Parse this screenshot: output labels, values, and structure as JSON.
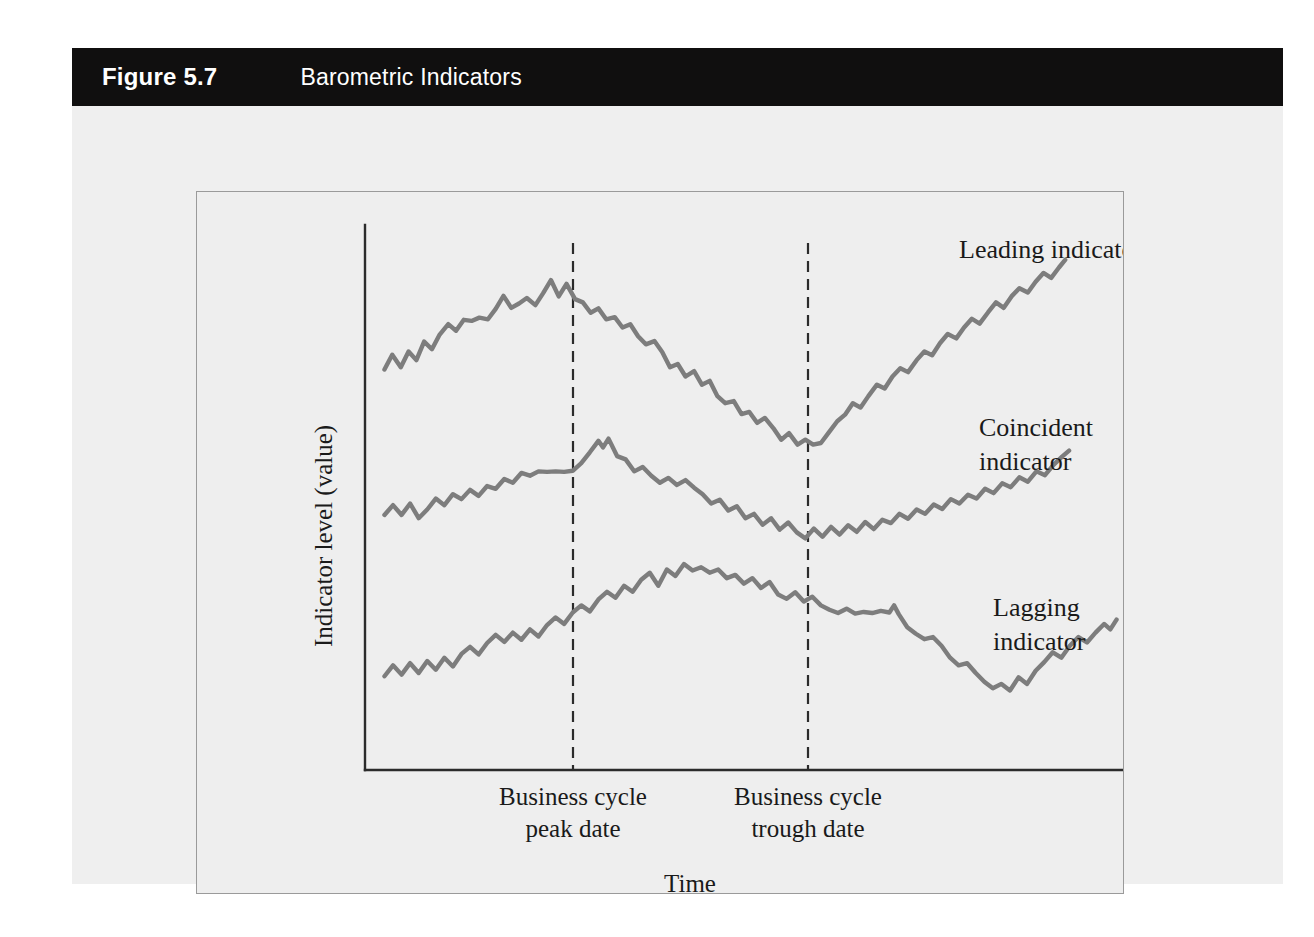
{
  "figure": {
    "number": "Figure 5.7",
    "title": "Barometric Indicators"
  },
  "chart_data": {
    "type": "line",
    "title": "Barometric Indicators",
    "xlabel": "Time",
    "ylabel": "Indicator level (value)",
    "grid": false,
    "legend_position": "right-inline",
    "axes": {
      "x_axis_visible": true,
      "y_axis_visible": true,
      "x_ticks": [],
      "y_ticks": []
    },
    "annotations": [
      {
        "name": "business-cycle-peak",
        "label_line1": "Business cycle",
        "label_line2": "peak date",
        "x": 0.3,
        "style": "vertical-dashed"
      },
      {
        "name": "business-cycle-trough",
        "label_line1": "Business cycle",
        "label_line2": "trough date",
        "x": 0.57,
        "style": "vertical-dashed"
      }
    ],
    "series": [
      {
        "name": "Leading indicator",
        "label_line1": "Leading indicator",
        "label_line2": "",
        "color": "#7d7d7d",
        "turning_points": {
          "peak_x": 0.18,
          "trough_x": 0.47
        },
        "points": [
          [
            0.025,
            0.735
          ],
          [
            0.035,
            0.762
          ],
          [
            0.046,
            0.739
          ],
          [
            0.056,
            0.768
          ],
          [
            0.066,
            0.752
          ],
          [
            0.076,
            0.786
          ],
          [
            0.086,
            0.772
          ],
          [
            0.096,
            0.799
          ],
          [
            0.107,
            0.818
          ],
          [
            0.117,
            0.806
          ],
          [
            0.127,
            0.826
          ],
          [
            0.137,
            0.824
          ],
          [
            0.147,
            0.83
          ],
          [
            0.158,
            0.827
          ],
          [
            0.168,
            0.846
          ],
          [
            0.178,
            0.87
          ],
          [
            0.188,
            0.848
          ],
          [
            0.198,
            0.856
          ],
          [
            0.208,
            0.866
          ],
          [
            0.219,
            0.853
          ],
          [
            0.229,
            0.875
          ],
          [
            0.239,
            0.899
          ],
          [
            0.249,
            0.869
          ],
          [
            0.259,
            0.892
          ],
          [
            0.27,
            0.864
          ],
          [
            0.28,
            0.858
          ],
          [
            0.29,
            0.839
          ],
          [
            0.3,
            0.847
          ],
          [
            0.31,
            0.827
          ],
          [
            0.321,
            0.831
          ],
          [
            0.331,
            0.812
          ],
          [
            0.341,
            0.818
          ],
          [
            0.351,
            0.796
          ],
          [
            0.361,
            0.781
          ],
          [
            0.372,
            0.787
          ],
          [
            0.382,
            0.767
          ],
          [
            0.392,
            0.739
          ],
          [
            0.402,
            0.745
          ],
          [
            0.412,
            0.722
          ],
          [
            0.423,
            0.732
          ],
          [
            0.433,
            0.707
          ],
          [
            0.443,
            0.714
          ],
          [
            0.453,
            0.686
          ],
          [
            0.463,
            0.673
          ],
          [
            0.474,
            0.677
          ],
          [
            0.484,
            0.653
          ],
          [
            0.494,
            0.657
          ],
          [
            0.504,
            0.637
          ],
          [
            0.514,
            0.646
          ],
          [
            0.525,
            0.627
          ],
          [
            0.535,
            0.606
          ],
          [
            0.545,
            0.618
          ],
          [
            0.556,
            0.597
          ],
          [
            0.566,
            0.606
          ],
          [
            0.576,
            0.597
          ],
          [
            0.586,
            0.6
          ],
          [
            0.596,
            0.619
          ],
          [
            0.607,
            0.64
          ],
          [
            0.617,
            0.652
          ],
          [
            0.627,
            0.673
          ],
          [
            0.637,
            0.665
          ],
          [
            0.647,
            0.686
          ],
          [
            0.658,
            0.707
          ],
          [
            0.668,
            0.7
          ],
          [
            0.678,
            0.722
          ],
          [
            0.688,
            0.737
          ],
          [
            0.698,
            0.73
          ],
          [
            0.709,
            0.752
          ],
          [
            0.719,
            0.768
          ],
          [
            0.729,
            0.761
          ],
          [
            0.739,
            0.783
          ],
          [
            0.749,
            0.8
          ],
          [
            0.76,
            0.792
          ],
          [
            0.77,
            0.812
          ],
          [
            0.78,
            0.828
          ],
          [
            0.79,
            0.819
          ],
          [
            0.801,
            0.84
          ],
          [
            0.811,
            0.858
          ],
          [
            0.821,
            0.848
          ],
          [
            0.831,
            0.869
          ],
          [
            0.841,
            0.884
          ],
          [
            0.852,
            0.876
          ],
          [
            0.862,
            0.896
          ],
          [
            0.872,
            0.912
          ],
          [
            0.882,
            0.903
          ],
          [
            0.892,
            0.922
          ],
          [
            0.9,
            0.936
          ]
        ]
      },
      {
        "name": "Coincident indicator",
        "label_line1": "Coincident",
        "label_line2": "indicator",
        "color": "#7d7d7d",
        "turning_points": {
          "peak_x": 0.3,
          "trough_x": 0.57
        },
        "points": [
          [
            0.025,
            0.468
          ],
          [
            0.036,
            0.486
          ],
          [
            0.047,
            0.468
          ],
          [
            0.058,
            0.489
          ],
          [
            0.069,
            0.462
          ],
          [
            0.08,
            0.478
          ],
          [
            0.091,
            0.498
          ],
          [
            0.102,
            0.486
          ],
          [
            0.113,
            0.506
          ],
          [
            0.124,
            0.497
          ],
          [
            0.135,
            0.514
          ],
          [
            0.146,
            0.503
          ],
          [
            0.157,
            0.521
          ],
          [
            0.168,
            0.516
          ],
          [
            0.179,
            0.534
          ],
          [
            0.19,
            0.527
          ],
          [
            0.201,
            0.545
          ],
          [
            0.212,
            0.54
          ],
          [
            0.223,
            0.548
          ],
          [
            0.234,
            0.547
          ],
          [
            0.245,
            0.548
          ],
          [
            0.256,
            0.547
          ],
          [
            0.267,
            0.549
          ],
          [
            0.278,
            0.563
          ],
          [
            0.289,
            0.583
          ],
          [
            0.3,
            0.604
          ],
          [
            0.306,
            0.592
          ],
          [
            0.313,
            0.608
          ],
          [
            0.324,
            0.576
          ],
          [
            0.335,
            0.57
          ],
          [
            0.346,
            0.548
          ],
          [
            0.357,
            0.556
          ],
          [
            0.368,
            0.54
          ],
          [
            0.379,
            0.527
          ],
          [
            0.39,
            0.536
          ],
          [
            0.401,
            0.523
          ],
          [
            0.412,
            0.532
          ],
          [
            0.423,
            0.518
          ],
          [
            0.434,
            0.506
          ],
          [
            0.445,
            0.489
          ],
          [
            0.456,
            0.496
          ],
          [
            0.467,
            0.476
          ],
          [
            0.478,
            0.484
          ],
          [
            0.489,
            0.462
          ],
          [
            0.5,
            0.47
          ],
          [
            0.511,
            0.45
          ],
          [
            0.522,
            0.462
          ],
          [
            0.533,
            0.441
          ],
          [
            0.544,
            0.454
          ],
          [
            0.555,
            0.436
          ],
          [
            0.566,
            0.425
          ],
          [
            0.577,
            0.443
          ],
          [
            0.588,
            0.428
          ],
          [
            0.599,
            0.446
          ],
          [
            0.61,
            0.432
          ],
          [
            0.621,
            0.449
          ],
          [
            0.632,
            0.437
          ],
          [
            0.643,
            0.455
          ],
          [
            0.654,
            0.442
          ],
          [
            0.665,
            0.459
          ],
          [
            0.676,
            0.453
          ],
          [
            0.687,
            0.47
          ],
          [
            0.698,
            0.461
          ],
          [
            0.709,
            0.478
          ],
          [
            0.72,
            0.47
          ],
          [
            0.731,
            0.487
          ],
          [
            0.742,
            0.479
          ],
          [
            0.753,
            0.497
          ],
          [
            0.764,
            0.489
          ],
          [
            0.775,
            0.505
          ],
          [
            0.786,
            0.498
          ],
          [
            0.797,
            0.516
          ],
          [
            0.808,
            0.508
          ],
          [
            0.819,
            0.526
          ],
          [
            0.83,
            0.519
          ],
          [
            0.841,
            0.537
          ],
          [
            0.852,
            0.529
          ],
          [
            0.863,
            0.548
          ],
          [
            0.874,
            0.541
          ],
          [
            0.885,
            0.56
          ],
          [
            0.896,
            0.575
          ],
          [
            0.905,
            0.586
          ]
        ]
      },
      {
        "name": "Lagging indicator",
        "label_line1": "Lagging",
        "label_line2": "indicator",
        "color": "#7d7d7d",
        "turning_points": {
          "peak_x": 0.39,
          "trough_x": 0.69
        },
        "points": [
          [
            0.025,
            0.172
          ],
          [
            0.036,
            0.192
          ],
          [
            0.047,
            0.175
          ],
          [
            0.058,
            0.196
          ],
          [
            0.069,
            0.178
          ],
          [
            0.08,
            0.2
          ],
          [
            0.091,
            0.184
          ],
          [
            0.102,
            0.206
          ],
          [
            0.113,
            0.19
          ],
          [
            0.124,
            0.213
          ],
          [
            0.135,
            0.226
          ],
          [
            0.146,
            0.212
          ],
          [
            0.157,
            0.233
          ],
          [
            0.168,
            0.248
          ],
          [
            0.179,
            0.235
          ],
          [
            0.19,
            0.252
          ],
          [
            0.201,
            0.239
          ],
          [
            0.212,
            0.258
          ],
          [
            0.223,
            0.245
          ],
          [
            0.234,
            0.266
          ],
          [
            0.245,
            0.28
          ],
          [
            0.256,
            0.268
          ],
          [
            0.267,
            0.289
          ],
          [
            0.278,
            0.302
          ],
          [
            0.289,
            0.291
          ],
          [
            0.3,
            0.313
          ],
          [
            0.311,
            0.327
          ],
          [
            0.322,
            0.316
          ],
          [
            0.333,
            0.338
          ],
          [
            0.344,
            0.327
          ],
          [
            0.355,
            0.349
          ],
          [
            0.366,
            0.362
          ],
          [
            0.377,
            0.338
          ],
          [
            0.388,
            0.368
          ],
          [
            0.399,
            0.356
          ],
          [
            0.41,
            0.378
          ],
          [
            0.421,
            0.366
          ],
          [
            0.432,
            0.372
          ],
          [
            0.443,
            0.362
          ],
          [
            0.454,
            0.368
          ],
          [
            0.465,
            0.352
          ],
          [
            0.476,
            0.358
          ],
          [
            0.487,
            0.342
          ],
          [
            0.498,
            0.352
          ],
          [
            0.509,
            0.334
          ],
          [
            0.52,
            0.345
          ],
          [
            0.531,
            0.322
          ],
          [
            0.542,
            0.314
          ],
          [
            0.553,
            0.326
          ],
          [
            0.564,
            0.309
          ],
          [
            0.575,
            0.318
          ],
          [
            0.586,
            0.302
          ],
          [
            0.597,
            0.294
          ],
          [
            0.608,
            0.288
          ],
          [
            0.619,
            0.296
          ],
          [
            0.63,
            0.287
          ],
          [
            0.641,
            0.29
          ],
          [
            0.652,
            0.288
          ],
          [
            0.663,
            0.292
          ],
          [
            0.674,
            0.289
          ],
          [
            0.68,
            0.302
          ],
          [
            0.686,
            0.286
          ],
          [
            0.697,
            0.262
          ],
          [
            0.708,
            0.25
          ],
          [
            0.719,
            0.24
          ],
          [
            0.73,
            0.244
          ],
          [
            0.741,
            0.228
          ],
          [
            0.752,
            0.206
          ],
          [
            0.763,
            0.192
          ],
          [
            0.774,
            0.196
          ],
          [
            0.785,
            0.178
          ],
          [
            0.796,
            0.162
          ],
          [
            0.807,
            0.15
          ],
          [
            0.818,
            0.158
          ],
          [
            0.829,
            0.146
          ],
          [
            0.84,
            0.17
          ],
          [
            0.851,
            0.158
          ],
          [
            0.862,
            0.182
          ],
          [
            0.873,
            0.198
          ],
          [
            0.884,
            0.216
          ],
          [
            0.895,
            0.206
          ],
          [
            0.906,
            0.228
          ],
          [
            0.917,
            0.244
          ],
          [
            0.928,
            0.234
          ],
          [
            0.939,
            0.252
          ],
          [
            0.95,
            0.268
          ],
          [
            0.958,
            0.258
          ],
          [
            0.966,
            0.276
          ]
        ]
      }
    ]
  }
}
